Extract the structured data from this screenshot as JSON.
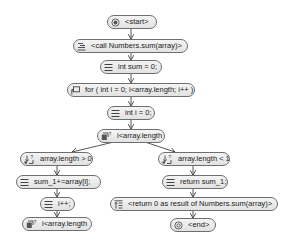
{
  "diagram": {
    "type": "flowchart",
    "nodes": [
      {
        "id": "start",
        "label": "<start>",
        "icon": "start-icon",
        "kind": "terminal"
      },
      {
        "id": "call",
        "label": "<call Numbers.sum(array)>",
        "icon": "call-icon",
        "kind": "call"
      },
      {
        "id": "int_sum",
        "label": "int sum = 0;",
        "icon": "statement-icon",
        "kind": "statement"
      },
      {
        "id": "for",
        "label": "for ( int i = 0; i<array.length; i++ )",
        "icon": "loop-icon",
        "kind": "loop"
      },
      {
        "id": "int_i",
        "label": "int i = 0;",
        "icon": "statement-icon",
        "kind": "statement"
      },
      {
        "id": "cond_mid",
        "label": "i<array.length",
        "icon": "condition-icon",
        "kind": "condition"
      },
      {
        "id": "cond_gt",
        "label": "array.length >  0",
        "icon": "branch-icon",
        "kind": "branch"
      },
      {
        "id": "cond_lt",
        "label": "array.length < 1",
        "icon": "branch-icon",
        "kind": "branch"
      },
      {
        "id": "sum_add",
        "label": "sum_1+=array[i];",
        "icon": "statement-icon",
        "kind": "statement"
      },
      {
        "id": "return_sum",
        "label": "return sum_1;",
        "icon": "statement-icon",
        "kind": "statement"
      },
      {
        "id": "inc",
        "label": "i++;",
        "icon": "statement-icon",
        "kind": "statement"
      },
      {
        "id": "return_0",
        "label": "<return 0 as result of Numbers.sum(array)>",
        "icon": "return-icon",
        "kind": "return"
      },
      {
        "id": "cond_bottom",
        "label": "i<array.length",
        "icon": "condition-icon",
        "kind": "condition"
      },
      {
        "id": "end",
        "label": "<end>",
        "icon": "end-icon",
        "kind": "terminal"
      }
    ],
    "edges": [
      [
        "start",
        "call"
      ],
      [
        "call",
        "int_sum"
      ],
      [
        "int_sum",
        "for"
      ],
      [
        "for",
        "int_i"
      ],
      [
        "int_i",
        "cond_mid"
      ],
      [
        "cond_mid",
        "cond_gt"
      ],
      [
        "cond_mid",
        "cond_lt"
      ],
      [
        "cond_gt",
        "sum_add"
      ],
      [
        "sum_add",
        "inc"
      ],
      [
        "inc",
        "cond_bottom"
      ],
      [
        "cond_lt",
        "return_sum"
      ],
      [
        "return_sum",
        "return_0"
      ],
      [
        "return_0",
        "end"
      ]
    ]
  },
  "colors": {
    "node_border": "#6e6e6e",
    "node_fill": "#e8e8e8",
    "edge": "#444444",
    "background": "#ffffff"
  }
}
